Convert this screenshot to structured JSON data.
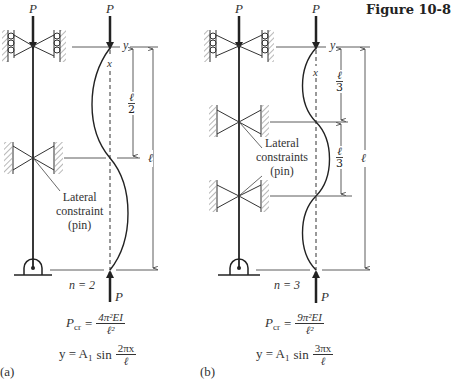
{
  "figure": {
    "title": "Figure 10-8",
    "colors": {
      "ink": "#222222",
      "hatch": "#777777",
      "background": "#ffffff"
    }
  },
  "panels": [
    {
      "id": "a",
      "label": "(a)",
      "load_top": "P",
      "load_bottom": "P",
      "axis_x": "x",
      "axis_y": "y",
      "constraint_note": [
        "Lateral",
        "constraint",
        "(pin)"
      ],
      "mode": "n = 2",
      "segment_dim": {
        "num": "ℓ",
        "den": "2"
      },
      "total_dim": "ℓ",
      "pcr": {
        "lhs": "P",
        "lhs_sub": "cr",
        "num": "4π²EI",
        "den": "ℓ²"
      },
      "shape": {
        "lhs": "y = A",
        "lhs_sub": "1",
        "fn": "sin",
        "num": "2πx",
        "den": "ℓ"
      }
    },
    {
      "id": "b",
      "label": "(b)",
      "load_top": "P",
      "load_bottom": "P",
      "axis_x": "x",
      "axis_y": "y",
      "constraint_note": [
        "Lateral",
        "constraints",
        "(pin)"
      ],
      "mode": "n = 3",
      "segment_dim": {
        "num": "ℓ",
        "den": "3"
      },
      "segment_dim_2": {
        "num": "ℓ",
        "den": "3"
      },
      "total_dim": "ℓ",
      "pcr": {
        "lhs": "P",
        "lhs_sub": "cr",
        "num": "9π²EI",
        "den": "ℓ²"
      },
      "shape": {
        "lhs": "y = A",
        "lhs_sub": "1",
        "fn": "sin",
        "num": "3πx",
        "den": "ℓ"
      }
    }
  ]
}
